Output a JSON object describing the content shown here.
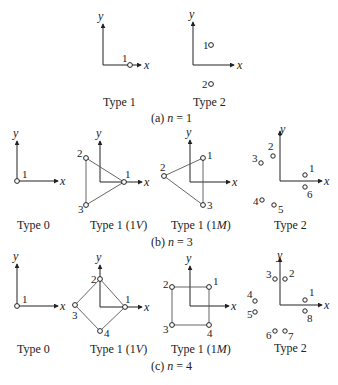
{
  "colors": {
    "ink": "#222222",
    "edge": "#555555",
    "background": "#ffffff"
  },
  "axis_labels": {
    "x": "x",
    "y": "y"
  },
  "sections": [
    {
      "caption_prefix": "(a) ",
      "caption_var": "n",
      "caption_suffix": " = 1",
      "panels": [
        {
          "label": "Type 1",
          "nodes": [
            "1"
          ]
        },
        {
          "label": "Type 2",
          "nodes": [
            "1",
            "2"
          ]
        }
      ]
    },
    {
      "caption_prefix": "(b) ",
      "caption_var": "n",
      "caption_suffix": " = 3",
      "panels": [
        {
          "label": "Type 0",
          "nodes": [
            "1"
          ]
        },
        {
          "label_main": "Type 1 (1",
          "label_italic": "V",
          "label_end": ")",
          "nodes": [
            "1",
            "2",
            "3"
          ]
        },
        {
          "label_main": "Type 1 (1",
          "label_italic": "M",
          "label_end": ")",
          "nodes": [
            "1",
            "2",
            "3"
          ]
        },
        {
          "label": "Type 2",
          "nodes": [
            "1",
            "2",
            "3",
            "4",
            "5",
            "6"
          ]
        }
      ]
    },
    {
      "caption_prefix": "(c) ",
      "caption_var": "n",
      "caption_suffix": " = 4",
      "panels": [
        {
          "label": "Type 0",
          "nodes": [
            "1"
          ]
        },
        {
          "label_main": "Type 1 (1",
          "label_italic": "V",
          "label_end": ")",
          "nodes": [
            "1",
            "2",
            "3",
            "4"
          ]
        },
        {
          "label_main": "Type 1 (1",
          "label_italic": "M",
          "label_end": ")",
          "nodes": [
            "1",
            "2",
            "3",
            "4"
          ]
        },
        {
          "label": "Type 2",
          "nodes": [
            "1",
            "2",
            "3",
            "4",
            "5",
            "6",
            "7",
            "8"
          ]
        }
      ]
    }
  ]
}
